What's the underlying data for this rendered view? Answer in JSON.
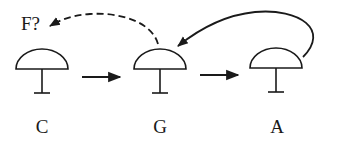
{
  "diagram": {
    "title_label": "F?",
    "neurons": [
      {
        "label": "C",
        "cx": 42
      },
      {
        "label": "G",
        "cx": 160
      },
      {
        "label": "A",
        "cx": 277
      }
    ],
    "connections": [
      {
        "from": "C",
        "to": "G",
        "style": "solid-straight"
      },
      {
        "from": "G",
        "to": "A",
        "style": "solid-straight"
      },
      {
        "from": "A",
        "to": "G",
        "style": "solid-curved"
      },
      {
        "from": "G",
        "to": "F?",
        "style": "dashed-curved"
      }
    ],
    "colors": {
      "stroke": "#1a1a1a",
      "background": "#ffffff"
    }
  }
}
